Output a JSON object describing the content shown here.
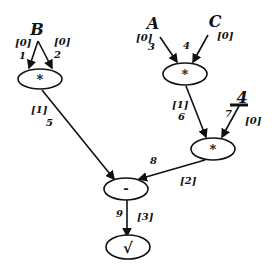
{
  "diagram": {
    "type": "expression-dag",
    "variables": {
      "B": "B",
      "A": "A",
      "C": "C",
      "const4": "4"
    },
    "nodes": {
      "mul_B": {
        "op": "*"
      },
      "mul_AC": {
        "op": "*"
      },
      "mul_4": {
        "op": "*"
      },
      "sub": {
        "op": "-"
      },
      "sqrt": {
        "op": "√"
      }
    },
    "edges": {
      "e1": {
        "id": "1",
        "level": "[0]"
      },
      "e2": {
        "id": "2",
        "level": "[0]"
      },
      "e3": {
        "id": "3",
        "level": "[0]"
      },
      "e4": {
        "id": "4",
        "level": "[0]"
      },
      "e5": {
        "id": "5",
        "level": "[1]"
      },
      "e6": {
        "id": "6",
        "level": "[1]"
      },
      "e7": {
        "id": "7",
        "level": "[0]"
      },
      "e8": {
        "id": "8",
        "level": "[2]"
      },
      "e9": {
        "id": "9",
        "level": "[3]"
      }
    }
  }
}
